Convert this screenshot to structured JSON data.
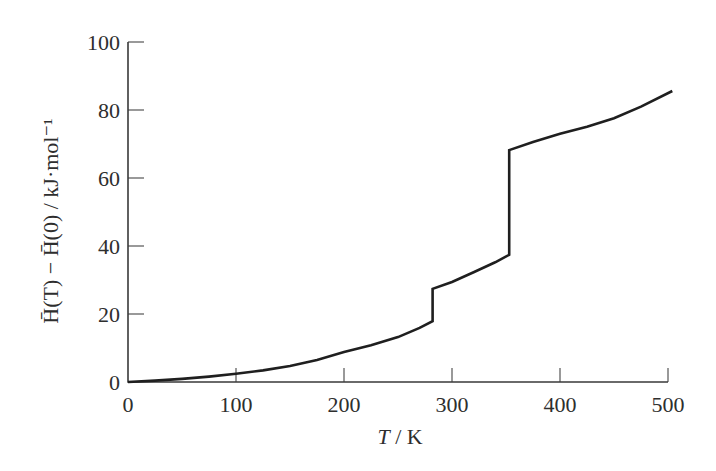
{
  "chart_data": {
    "type": "line",
    "title": "",
    "xlabel": "T / K",
    "ylabel": "H̄(T) − H̄(0) / kJ·mol⁻¹",
    "xlim": [
      0,
      500
    ],
    "ylim": [
      0,
      100
    ],
    "x_ticks": [
      0,
      100,
      200,
      300,
      400,
      500
    ],
    "y_ticks": [
      0,
      20,
      40,
      60,
      80,
      100
    ],
    "grid": false,
    "legend": null,
    "series": [
      {
        "name": "H(T) - H(0)",
        "color": "#1f1f1f",
        "x": [
          0,
          25,
          50,
          75,
          100,
          125,
          150,
          175,
          200,
          225,
          250,
          270,
          282,
          282,
          300,
          320,
          340,
          353,
          353,
          375,
          400,
          425,
          450,
          475,
          504
        ],
        "values": [
          0,
          0.4,
          0.9,
          1.6,
          2.4,
          3.4,
          4.7,
          6.5,
          8.8,
          10.8,
          13.2,
          15.9,
          17.9,
          27.4,
          29.4,
          32.3,
          35.2,
          37.4,
          68.2,
          70.6,
          73.0,
          75.1,
          77.6,
          81.0,
          85.6
        ]
      }
    ],
    "annotations": [
      {
        "type": "discontinuity",
        "x": 282,
        "from": 17.9,
        "to": 27.4
      },
      {
        "type": "discontinuity",
        "x": 353,
        "from": 37.4,
        "to": 68.2
      }
    ]
  },
  "labels": {
    "xlabel_italic": "T",
    "xlabel_unit": " / K",
    "ylabel_text": "H̄(T) − H̄(0) / kJ·mol⁻¹"
  }
}
